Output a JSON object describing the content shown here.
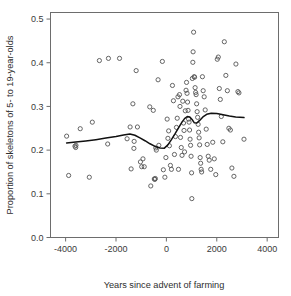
{
  "chart_data": {
    "type": "scatter",
    "title": "",
    "subtitle": "",
    "xlabel": "Years since advent of farming",
    "ylabel": "Proportion of skeletons of 5- to 19-year-olds",
    "xlim": [
      -4600,
      4450
    ],
    "ylim": [
      0.0,
      0.515
    ],
    "grid": false,
    "legend": null,
    "legend_position": "none",
    "xticks": [
      -4000,
      -2000,
      0,
      2000,
      4000
    ],
    "xtick_labels": [
      "-4000",
      "-2000",
      "0",
      "2000",
      "4000"
    ],
    "yticks": [
      0.0,
      0.1,
      0.2,
      0.3,
      0.4,
      0.5
    ],
    "ytick_labels": [
      "0.0",
      "0.1",
      "0.2",
      "0.3",
      "0.4",
      "0.5"
    ],
    "marker": "open-circle",
    "marker_color": "#555555",
    "line_color": "#111111",
    "series": [
      {
        "name": "skeleton samples",
        "type": "scatter",
        "points": [
          [
            -3960,
            0.232
          ],
          [
            -3880,
            0.142
          ],
          [
            -3630,
            0.209
          ],
          [
            -3600,
            0.206
          ],
          [
            -3590,
            0.211
          ],
          [
            -3420,
            0.249
          ],
          [
            -3060,
            0.138
          ],
          [
            -2940,
            0.264
          ],
          [
            -2660,
            0.405
          ],
          [
            -2330,
            0.214
          ],
          [
            -2300,
            0.41
          ],
          [
            -1860,
            0.41
          ],
          [
            -1560,
            0.226
          ],
          [
            -1440,
            0.253
          ],
          [
            -1400,
            0.157
          ],
          [
            -1330,
            0.306
          ],
          [
            -1290,
            0.204
          ],
          [
            -1280,
            0.22
          ],
          [
            -1200,
            0.382
          ],
          [
            -1150,
            0.253
          ],
          [
            -1030,
            0.173
          ],
          [
            -980,
            0.162
          ],
          [
            -930,
            0.18
          ],
          [
            -880,
            0.162
          ],
          [
            -660,
            0.299
          ],
          [
            -620,
            0.118
          ],
          [
            -520,
            0.291
          ],
          [
            -480,
            0.134
          ],
          [
            -460,
            0.133
          ],
          [
            -440,
            0.135
          ],
          [
            -420,
            0.205
          ],
          [
            -400,
            0.2
          ],
          [
            -330,
            0.361
          ],
          [
            -300,
            0.211
          ],
          [
            -160,
            0.403
          ],
          [
            -120,
            0.155
          ],
          [
            -60,
            0.138
          ],
          [
            -20,
            0.183
          ],
          [
            30,
            0.271
          ],
          [
            60,
            0.227
          ],
          [
            90,
            0.244
          ],
          [
            120,
            0.21
          ],
          [
            160,
            0.165
          ],
          [
            200,
            0.156
          ],
          [
            240,
            0.348
          ],
          [
            280,
            0.313
          ],
          [
            320,
            0.19
          ],
          [
            360,
            0.231
          ],
          [
            400,
            0.252
          ],
          [
            430,
            0.273
          ],
          [
            460,
            0.322
          ],
          [
            480,
            0.156
          ],
          [
            520,
            0.327
          ],
          [
            540,
            0.3
          ],
          [
            560,
            0.229
          ],
          [
            590,
            0.206
          ],
          [
            620,
            0.188
          ],
          [
            650,
            0.312
          ],
          [
            680,
            0.262
          ],
          [
            700,
            0.245
          ],
          [
            720,
            0.196
          ],
          [
            750,
            0.29
          ],
          [
            780,
            0.337
          ],
          [
            800,
            0.355
          ],
          [
            820,
            0.33
          ],
          [
            840,
            0.31
          ],
          [
            860,
            0.291
          ],
          [
            880,
            0.271
          ],
          [
            900,
            0.264
          ],
          [
            920,
            0.246
          ],
          [
            940,
            0.225
          ],
          [
            960,
            0.211
          ],
          [
            980,
            0.186
          ],
          [
            1000,
            0.148
          ],
          [
            1010,
            0.089
          ],
          [
            1030,
            0.364
          ],
          [
            1050,
            0.401
          ],
          [
            1060,
            0.425
          ],
          [
            1080,
            0.47
          ],
          [
            1100,
            0.368
          ],
          [
            1120,
            0.367
          ],
          [
            1140,
            0.343
          ],
          [
            1160,
            0.332
          ],
          [
            1180,
            0.327
          ],
          [
            1200,
            0.306
          ],
          [
            1220,
            0.288
          ],
          [
            1240,
            0.275
          ],
          [
            1260,
            0.259
          ],
          [
            1280,
            0.241
          ],
          [
            1300,
            0.228
          ],
          [
            1320,
            0.212
          ],
          [
            1340,
            0.183
          ],
          [
            1360,
            0.17
          ],
          [
            1380,
            0.156
          ],
          [
            1400,
            0.15
          ],
          [
            1430,
            0.368
          ],
          [
            1460,
            0.336
          ],
          [
            1500,
            0.322
          ],
          [
            1540,
            0.292
          ],
          [
            1580,
            0.248
          ],
          [
            1620,
            0.213
          ],
          [
            1660,
            0.186
          ],
          [
            1700,
            0.177
          ],
          [
            1760,
            0.156
          ],
          [
            1840,
            0.218
          ],
          [
            1900,
            0.18
          ],
          [
            1960,
            0.144
          ],
          [
            2020,
            0.408
          ],
          [
            2060,
            0.413
          ],
          [
            2100,
            0.341
          ],
          [
            2140,
            0.316
          ],
          [
            2180,
            0.277
          ],
          [
            2240,
            0.219
          ],
          [
            2300,
            0.448
          ],
          [
            2360,
            0.371
          ],
          [
            2420,
            0.336
          ],
          [
            2480,
            0.25
          ],
          [
            2540,
            0.246
          ],
          [
            2600,
            0.159
          ],
          [
            2680,
            0.14
          ],
          [
            2760,
            0.397
          ],
          [
            2840,
            0.334
          ],
          [
            2880,
            0.331
          ],
          [
            3080,
            0.225
          ]
        ]
      },
      {
        "name": "lowess trend",
        "type": "line",
        "points": [
          [
            -3960,
            0.2165
          ],
          [
            -3600,
            0.2185
          ],
          [
            -3200,
            0.221
          ],
          [
            -2800,
            0.224
          ],
          [
            -2400,
            0.2275
          ],
          [
            -2000,
            0.231
          ],
          [
            -1700,
            0.2345
          ],
          [
            -1450,
            0.237
          ],
          [
            -1250,
            0.234
          ],
          [
            -1050,
            0.228
          ],
          [
            -850,
            0.2215
          ],
          [
            -650,
            0.2145
          ],
          [
            -450,
            0.2085
          ],
          [
            -250,
            0.205
          ],
          [
            -80,
            0.2045
          ],
          [
            60,
            0.212
          ],
          [
            200,
            0.224
          ],
          [
            340,
            0.237
          ],
          [
            470,
            0.25
          ],
          [
            600,
            0.2625
          ],
          [
            720,
            0.272
          ],
          [
            830,
            0.277
          ],
          [
            930,
            0.276
          ],
          [
            1020,
            0.27
          ],
          [
            1110,
            0.2625
          ],
          [
            1210,
            0.262
          ],
          [
            1320,
            0.268
          ],
          [
            1450,
            0.276
          ],
          [
            1600,
            0.282
          ],
          [
            1780,
            0.2845
          ],
          [
            2000,
            0.284
          ],
          [
            2250,
            0.281
          ],
          [
            2500,
            0.278
          ],
          [
            2750,
            0.276
          ],
          [
            3080,
            0.2745
          ]
        ]
      }
    ]
  }
}
